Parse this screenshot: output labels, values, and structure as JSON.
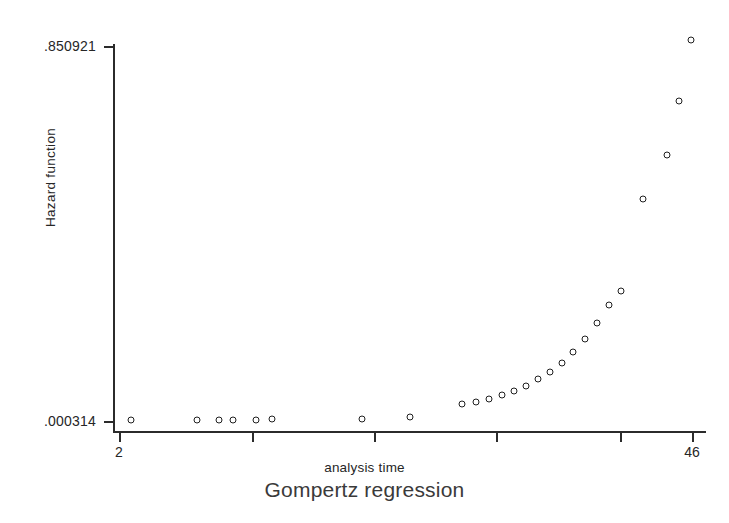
{
  "chart_data": {
    "type": "scatter",
    "title": "Gompertz regression",
    "xlabel": "analysis time",
    "ylabel": "Hazard function",
    "xlim": [
      2,
      46
    ],
    "ylim": [
      0.000314,
      0.850921
    ],
    "grid": false,
    "legend": null,
    "x_tick_labels": [
      "2",
      "46"
    ],
    "y_tick_labels": [
      ".850921",
      ".000314"
    ],
    "x_ticks_unlabeled_count": 3,
    "marker": "open-circle",
    "x": [
      2,
      7,
      9,
      11,
      13,
      14,
      21,
      25,
      29,
      30,
      31,
      32,
      33,
      34,
      35,
      36,
      37,
      38,
      39,
      40,
      41,
      42,
      43,
      44,
      45,
      46
    ],
    "y": [
      0.0003,
      0.0006,
      0.0008,
      0.0011,
      0.0014,
      0.0016,
      0.0032,
      0.0061,
      0.022,
      0.028,
      0.035,
      0.044,
      0.054,
      0.066,
      0.081,
      0.098,
      0.12,
      0.146,
      0.18,
      0.22,
      0.27,
      0.334,
      0.412,
      0.508,
      0.628,
      0.79
    ],
    "points_px": [
      {
        "x": 131,
        "y": 420
      },
      {
        "x": 197,
        "y": 420
      },
      {
        "x": 219,
        "y": 420
      },
      {
        "x": 233,
        "y": 420
      },
      {
        "x": 256,
        "y": 420
      },
      {
        "x": 272,
        "y": 419
      },
      {
        "x": 362,
        "y": 419
      },
      {
        "x": 410,
        "y": 417
      },
      {
        "x": 462,
        "y": 404
      },
      {
        "x": 476,
        "y": 402
      },
      {
        "x": 489,
        "y": 399
      },
      {
        "x": 502,
        "y": 395
      },
      {
        "x": 514,
        "y": 391
      },
      {
        "x": 526,
        "y": 386
      },
      {
        "x": 538,
        "y": 379
      },
      {
        "x": 550,
        "y": 372
      },
      {
        "x": 562,
        "y": 363
      },
      {
        "x": 573,
        "y": 352
      },
      {
        "x": 585,
        "y": 339
      },
      {
        "x": 597,
        "y": 323
      },
      {
        "x": 609,
        "y": 305
      },
      {
        "x": 621,
        "y": 291
      },
      {
        "x": 643,
        "y": 199
      },
      {
        "x": 667,
        "y": 155
      },
      {
        "x": 679,
        "y": 101
      },
      {
        "x": 691,
        "y": 40
      }
    ],
    "axis_px": {
      "x_left": 113,
      "x_right": 706,
      "y_top": 44,
      "y_bottom": 432,
      "x_tick_positions": [
        119,
        252,
        374,
        496,
        620,
        692
      ],
      "x_labeled_ticks": [
        {
          "px": 119,
          "label": "2"
        },
        {
          "px": 692,
          "label": "46"
        }
      ],
      "y_tick_positions": [
        46,
        421
      ]
    }
  },
  "colors": {
    "background": "#ffffff",
    "axis": "#2b2b2b",
    "marker_stroke": "#1f1f1f",
    "marker_fill": "#ffffff",
    "text": "#262626",
    "title_text": "#3a3a3a"
  }
}
